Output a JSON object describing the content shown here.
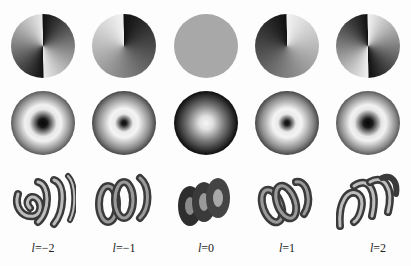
{
  "figure": {
    "rows": [
      "phase distribution",
      "intensity distribution",
      "helical wavefront"
    ],
    "columns": [
      {
        "l": -2,
        "label_var": "l",
        "label_rest": "=−2",
        "x": 43
      },
      {
        "l": -1,
        "label_var": "l",
        "label_rest": "=−1",
        "x": 124
      },
      {
        "l": 0,
        "label_var": "l",
        "label_rest": "=0",
        "x": 206
      },
      {
        "l": 1,
        "label_var": "l",
        "label_rest": "=1",
        "x": 287
      },
      {
        "l": 2,
        "label_var": "l",
        "label_rest": "=2",
        "x": 368
      }
    ]
  },
  "colors": {
    "background": "#fdfdfd",
    "dark": "#0a0a0a",
    "mid_gray": "#a8a8a8",
    "light": "#f4f4f4",
    "helix_dark": "#3a3a3a",
    "helix_mid": "#7a7a7a",
    "helix_light": "#bdbdbd"
  }
}
